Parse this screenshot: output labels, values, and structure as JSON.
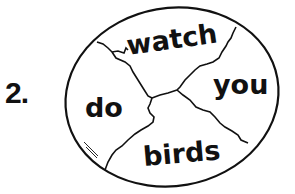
{
  "exercise": {
    "number_label": "2.",
    "pieces": [
      {
        "id": "top",
        "word": "watch"
      },
      {
        "id": "right",
        "word": "you"
      },
      {
        "id": "left",
        "word": "do"
      },
      {
        "id": "bottom",
        "word": "birds"
      }
    ]
  },
  "colors": {
    "ink": "#111111",
    "background": "#ffffff"
  }
}
